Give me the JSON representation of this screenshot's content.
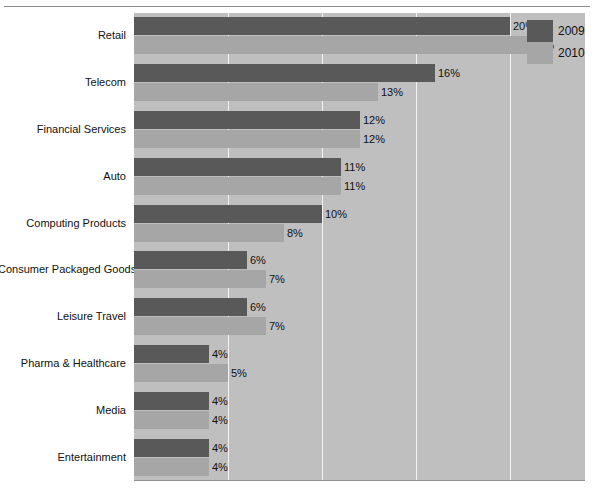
{
  "chart_data": {
    "type": "bar",
    "orientation": "horizontal",
    "title": "",
    "subtitle": "",
    "xlabel": "",
    "ylabel": "",
    "xlim": [
      0,
      24
    ],
    "grid": true,
    "gridline_values": [
      5,
      10,
      15,
      20
    ],
    "legend_position": "top-right",
    "value_suffix": "%",
    "categories": [
      "Retail",
      "Telecom",
      "Financial Services",
      "Auto",
      "Computing Products",
      "Consumer Packaged Goods",
      "Leisure Travel",
      "Pharma & Healthcare",
      "Media",
      "Entertainment"
    ],
    "series": [
      {
        "name": "2009",
        "color": "#595959",
        "values": [
          20,
          16,
          12,
          11,
          10,
          6,
          6,
          4,
          4,
          4
        ],
        "labels": [
          "20%",
          "16%",
          "12%",
          "11%",
          "10%",
          "6%",
          "6%",
          "4%",
          "4%",
          "4%"
        ]
      },
      {
        "name": "2010",
        "color": "#a6a6a6",
        "values": [
          21,
          13,
          12,
          11,
          8,
          7,
          7,
          5,
          4,
          4
        ],
        "labels": [
          "21%",
          "13%",
          "12%",
          "11%",
          "8%",
          "7%",
          "7%",
          "5%",
          "4%",
          "4%"
        ]
      }
    ]
  },
  "legend": {
    "items": [
      {
        "label": "2009",
        "color": "#595959"
      },
      {
        "label": "2010",
        "color": "#a6a6a6"
      }
    ]
  },
  "colors": {
    "plot_background": "#bfbfbf",
    "gridline": "#f2f2f2",
    "series_2009": "#595959",
    "series_2010": "#a6a6a6",
    "text": "#111111",
    "top_rule": "#8c8c8c"
  }
}
